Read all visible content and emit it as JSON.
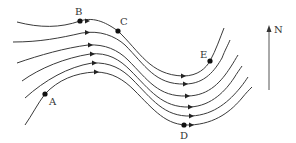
{
  "diagram": {
    "type": "streamline-flow",
    "points": [
      {
        "label": "A",
        "x": 45,
        "y": 94,
        "lx": 49,
        "ly": 105
      },
      {
        "label": "B",
        "x": 80,
        "y": 21,
        "lx": 75,
        "ly": 15
      },
      {
        "label": "C",
        "x": 118,
        "y": 31,
        "lx": 120,
        "ly": 25
      },
      {
        "label": "D",
        "x": 184,
        "y": 125,
        "lx": 180,
        "ly": 139
      },
      {
        "label": "E",
        "x": 210,
        "y": 61,
        "lx": 200,
        "ly": 58
      }
    ],
    "north": {
      "label": "N",
      "x": 276,
      "y_top": 26,
      "y_bottom": 90
    },
    "line_color": "#3a3a3a",
    "point_color": "#111111"
  }
}
